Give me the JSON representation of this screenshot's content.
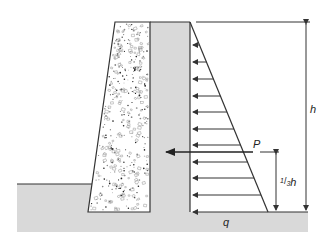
{
  "diagram": {
    "labels": {
      "height": "h",
      "resultant_force": "P",
      "resultant_height_num": "1",
      "resultant_height_den": "3",
      "resultant_height_var": "h",
      "base_pressure": "q"
    },
    "colors": {
      "soil": "#d9d9d9",
      "concrete": "#ffffff",
      "line": "#333333",
      "speckle": "#555555"
    },
    "pressure_arrows_y": [
      45,
      62,
      79,
      96,
      112,
      129,
      145,
      162,
      178,
      195
    ],
    "geometry": {
      "wall_top_y": 22,
      "wall_base_y": 212,
      "wall_back_x": 150,
      "pressure_face_x": 190,
      "triangle_base_x": 268,
      "resultant_y": 152
    }
  }
}
